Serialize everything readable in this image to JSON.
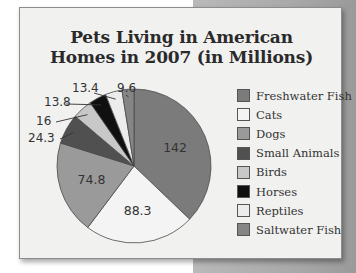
{
  "chart_data": {
    "type": "pie",
    "title": "Pets Living in American Homes in 2007 (in Millions)",
    "title_lines": [
      "Pets Living in American",
      "Homes in 2007 (in Millions)"
    ],
    "categories": [
      "Freshwater Fish",
      "Cats",
      "Dogs",
      "Small Animals",
      "Birds",
      "Horses",
      "Reptiles",
      "Saltwater Fish"
    ],
    "values": [
      142,
      88.3,
      74.8,
      24.3,
      16,
      13.8,
      13.4,
      9.6
    ],
    "value_labels": [
      "142",
      "88.3",
      "74.8",
      "24.3",
      "16",
      "13.8",
      "13.4",
      "9.6"
    ],
    "colors": [
      "#7b7b7b",
      "#f4f4f4",
      "#9a9a9a",
      "#505050",
      "#c8c8c8",
      "#101010",
      "#ececec",
      "#858585"
    ],
    "legend_position": "right",
    "start_angle_deg": 0,
    "direction": "clockwise"
  }
}
